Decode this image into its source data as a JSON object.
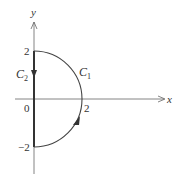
{
  "figure": {
    "type": "contour-diagram",
    "axes": {
      "x_label": "x",
      "y_label": "y",
      "origin_label": "0"
    },
    "ticks": {
      "y_top": "2",
      "y_bottom": "−2",
      "x_right": "2"
    },
    "curves": [
      {
        "name": "C1",
        "label_main": "C",
        "label_sub": "1",
        "shape": "semicircle",
        "radius": 2,
        "direction": "counterclockwise (upward on right side)"
      },
      {
        "name": "C2",
        "label_main": "C",
        "label_sub": "2",
        "shape": "line segment on y-axis",
        "from": [
          0,
          2
        ],
        "to": [
          0,
          -2
        ],
        "direction": "downward"
      }
    ],
    "colors": {
      "axis": "#555555",
      "curve": "#333333",
      "text": "#333333"
    }
  }
}
